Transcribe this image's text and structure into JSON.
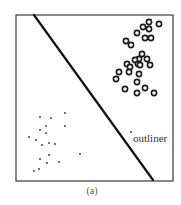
{
  "figure": {
    "caption": "(a)",
    "annotation": "outliner"
  },
  "chart_data": {
    "type": "scatter",
    "title": "",
    "xlabel": "",
    "ylabel": "",
    "caption": "(a)",
    "grid": false,
    "axes_ticks": false,
    "legend": null,
    "frame": {
      "x": 16,
      "y": 15,
      "width": 157,
      "height": 166
    },
    "decision_boundary": {
      "x1": 34,
      "y1": 15,
      "x2": 153,
      "y2": 180
    },
    "series": [
      {
        "name": "class-circles",
        "marker": "open-circle",
        "points": [
          [
            149,
            22
          ],
          [
            159,
            24
          ],
          [
            143,
            27
          ],
          [
            149,
            29
          ],
          [
            137,
            33
          ],
          [
            145,
            38
          ],
          [
            151,
            38
          ],
          [
            126,
            41
          ],
          [
            131,
            45
          ],
          [
            142,
            54
          ],
          [
            139,
            59
          ],
          [
            147,
            59
          ],
          [
            135,
            60
          ],
          [
            138,
            64
          ],
          [
            127,
            64
          ],
          [
            130,
            67
          ],
          [
            140,
            65
          ],
          [
            150,
            65
          ],
          [
            119,
            72
          ],
          [
            129,
            72
          ],
          [
            116,
            79
          ],
          [
            139,
            74
          ],
          [
            137,
            82
          ],
          [
            125,
            89
          ],
          [
            145,
            88
          ],
          [
            137,
            93
          ],
          [
            154,
            93
          ]
        ]
      },
      {
        "name": "class-dots",
        "marker": "small-dot",
        "points": [
          [
            40,
            117
          ],
          [
            51,
            118
          ],
          [
            65,
            113
          ],
          [
            46,
            126
          ],
          [
            40,
            130
          ],
          [
            65,
            126
          ],
          [
            46,
            133
          ],
          [
            29,
            137
          ],
          [
            36,
            140
          ],
          [
            42,
            145
          ],
          [
            49,
            143
          ],
          [
            55,
            144
          ],
          [
            49,
            155
          ],
          [
            40,
            159
          ],
          [
            47,
            163
          ],
          [
            59,
            162
          ],
          [
            80,
            154
          ],
          [
            34,
            171
          ],
          [
            39,
            169
          ]
        ]
      },
      {
        "name": "outlier",
        "marker": "small-dot",
        "points": [
          [
            131,
            132
          ]
        ],
        "label": "outliner"
      }
    ],
    "annotations": [
      {
        "text": "outliner",
        "x": 133,
        "y": 142
      }
    ]
  }
}
